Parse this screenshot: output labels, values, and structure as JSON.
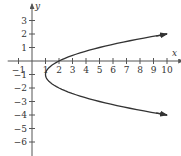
{
  "chart_data": {
    "type": "line",
    "title": "",
    "xlabel": "x",
    "ylabel": "y",
    "xlim": [
      -1.8,
      11.2
    ],
    "ylim": [
      -6.8,
      4.2
    ],
    "x_ticks": [
      -1,
      1,
      2,
      3,
      4,
      5,
      6,
      7,
      8,
      9,
      10
    ],
    "y_ticks": [
      3,
      2,
      1,
      -1,
      -2,
      -3,
      -4,
      -5,
      -6
    ],
    "x_tick_labels": [
      "-1",
      "1",
      "2",
      "3",
      "4",
      "5",
      "6",
      "7",
      "8",
      "9",
      "10"
    ],
    "y_tick_labels": [
      "3",
      "2",
      "1",
      "-1",
      "-2",
      "-3",
      "-4",
      "-5",
      "-6"
    ],
    "grid": false,
    "legend": null,
    "series": [
      {
        "name": "x = (y+1)^2 + 1",
        "description": "Horizontal parabola opening right, vertex at (1, -1), arrows at both ends",
        "vertex": [
          1,
          -1
        ],
        "y_range": [
          -4,
          2
        ],
        "points": [
          {
            "x": 10,
            "y": 2
          },
          {
            "x": 5,
            "y": 1
          },
          {
            "x": 2,
            "y": 0
          },
          {
            "x": 1,
            "y": -1
          },
          {
            "x": 2,
            "y": -2
          },
          {
            "x": 5,
            "y": -3
          },
          {
            "x": 10,
            "y": -4
          }
        ],
        "color": "#333333"
      }
    ]
  },
  "style": {
    "axis_color": "#555555",
    "curve_color": "#333333",
    "text_color": "#333333"
  }
}
